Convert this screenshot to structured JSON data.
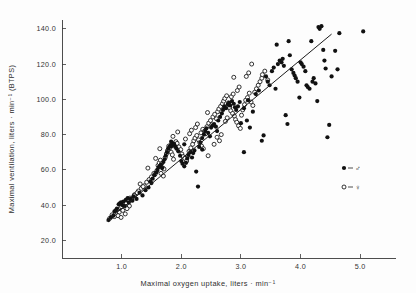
{
  "figure": {
    "background_color": "#fdfdfd",
    "ink_color": "#111111"
  },
  "legend": {
    "position": "bottom-right",
    "entries": [
      {
        "symbol": "filled-circle",
        "separator": "=",
        "label": "♂",
        "meaning": "male"
      },
      {
        "symbol": "open-circle",
        "separator": "=",
        "label": "♀",
        "meaning": "female"
      }
    ]
  },
  "chart_data": {
    "type": "scatter",
    "title": "",
    "subtitle": "",
    "xlabel": "Maximal oxygen uptake, liters · min⁻¹",
    "ylabel": "Maximal ventilation, liters · min⁻¹ (BTPS)",
    "xlim": [
      0.0,
      5.6
    ],
    "ylim": [
      10.0,
      145.0
    ],
    "xticks": [
      1.0,
      2.0,
      3.0,
      4.0,
      5.0
    ],
    "xtick_labels": [
      "1.0",
      "2.0",
      "3.0",
      "4.0",
      "5.0"
    ],
    "yticks": [
      20.0,
      40.0,
      60.0,
      80.0,
      100.0,
      120.0,
      140.0
    ],
    "ytick_labels": [
      "20.0",
      "40.0",
      "60.0",
      "80.0",
      "100.0",
      "120.0",
      "140.0"
    ],
    "grid": false,
    "legend_position": "lower right",
    "axes_spines": [
      "left",
      "bottom"
    ],
    "trendline": {
      "type": "linear-regression",
      "x_start": 0.75,
      "y_start": 31.0,
      "x_end": 4.52,
      "y_end": 137.0,
      "color": "#1c1c1c"
    },
    "series": [
      {
        "name": "♂",
        "marker": "filled-circle",
        "color": "#111111",
        "points": [
          [
            0.78,
            31.5
          ],
          [
            0.82,
            33.0
          ],
          [
            0.86,
            34.0
          ],
          [
            0.88,
            36.5
          ],
          [
            0.92,
            38.0
          ],
          [
            0.95,
            40.5
          ],
          [
            0.97,
            41.0
          ],
          [
            0.99,
            41.5
          ],
          [
            1.01,
            40.0
          ],
          [
            1.03,
            42.0
          ],
          [
            1.05,
            39.5
          ],
          [
            1.07,
            43.0
          ],
          [
            1.1,
            44.0
          ],
          [
            1.12,
            41.5
          ],
          [
            1.15,
            43.5
          ],
          [
            1.2,
            45.0
          ],
          [
            1.25,
            43.5
          ],
          [
            1.3,
            47.0
          ],
          [
            1.35,
            45.5
          ],
          [
            1.4,
            48.5
          ],
          [
            1.45,
            50.0
          ],
          [
            1.5,
            52.5
          ],
          [
            1.52,
            55.0
          ],
          [
            1.55,
            57.0
          ],
          [
            1.58,
            58.5
          ],
          [
            1.6,
            60.0
          ],
          [
            1.62,
            61.5
          ],
          [
            1.64,
            62.0
          ],
          [
            1.66,
            63.0
          ],
          [
            1.68,
            61.0
          ],
          [
            1.7,
            64.5
          ],
          [
            1.72,
            66.0
          ],
          [
            1.74,
            68.0
          ],
          [
            1.76,
            70.0
          ],
          [
            1.78,
            72.0
          ],
          [
            1.8,
            73.0
          ],
          [
            1.82,
            74.0
          ],
          [
            1.84,
            73.5
          ],
          [
            1.86,
            75.0
          ],
          [
            1.88,
            74.5
          ],
          [
            1.9,
            73.0
          ],
          [
            1.92,
            72.0
          ],
          [
            1.95,
            70.5
          ],
          [
            1.98,
            68.0
          ],
          [
            2.0,
            65.0
          ],
          [
            2.02,
            63.5
          ],
          [
            2.05,
            62.0
          ],
          [
            2.08,
            64.0
          ],
          [
            2.1,
            66.5
          ],
          [
            2.12,
            68.5
          ],
          [
            2.15,
            70.0
          ],
          [
            2.18,
            67.0
          ],
          [
            2.2,
            69.5
          ],
          [
            2.22,
            71.0
          ],
          [
            2.25,
            59.0
          ],
          [
            2.28,
            50.5
          ],
          [
            2.3,
            73.0
          ],
          [
            2.32,
            75.5
          ],
          [
            2.35,
            78.0
          ],
          [
            2.38,
            80.0
          ],
          [
            2.4,
            82.0
          ],
          [
            2.42,
            83.5
          ],
          [
            2.45,
            81.0
          ],
          [
            2.48,
            79.0
          ],
          [
            2.5,
            84.0
          ],
          [
            2.55,
            86.0
          ],
          [
            2.58,
            84.5
          ],
          [
            2.62,
            88.0
          ],
          [
            2.65,
            90.0
          ],
          [
            2.68,
            92.0
          ],
          [
            2.7,
            94.0
          ],
          [
            2.72,
            96.0
          ],
          [
            2.75,
            95.0
          ],
          [
            2.78,
            97.0
          ],
          [
            2.8,
            98.0
          ],
          [
            2.82,
            96.5
          ],
          [
            2.85,
            99.0
          ],
          [
            2.88,
            97.5
          ],
          [
            2.9,
            95.5
          ],
          [
            2.92,
            94.0
          ],
          [
            2.95,
            96.0
          ],
          [
            2.98,
            98.5
          ],
          [
            3.0,
            86.5
          ],
          [
            3.05,
            70.0
          ],
          [
            3.1,
            88.0
          ],
          [
            3.15,
            84.0
          ],
          [
            3.2,
            93.0
          ],
          [
            3.25,
            103.0
          ],
          [
            3.3,
            105.0
          ],
          [
            3.35,
            76.5
          ],
          [
            3.38,
            79.5
          ],
          [
            3.42,
            113.0
          ],
          [
            3.45,
            110.0
          ],
          [
            3.48,
            108.0
          ],
          [
            3.52,
            116.0
          ],
          [
            3.55,
            118.0
          ],
          [
            3.58,
            106.0
          ],
          [
            3.6,
            131.0
          ],
          [
            3.62,
            120.0
          ],
          [
            3.65,
            122.0
          ],
          [
            3.68,
            121.0
          ],
          [
            3.7,
            123.0
          ],
          [
            3.72,
            119.0
          ],
          [
            3.75,
            91.0
          ],
          [
            3.78,
            86.0
          ],
          [
            3.8,
            133.0
          ],
          [
            3.82,
            125.0
          ],
          [
            3.85,
            117.0
          ],
          [
            3.88,
            115.0
          ],
          [
            3.9,
            113.5
          ],
          [
            3.92,
            112.0
          ],
          [
            3.95,
            110.0
          ],
          [
            3.98,
            101.0
          ],
          [
            4.0,
            121.0
          ],
          [
            4.02,
            120.0
          ],
          [
            4.05,
            118.5
          ],
          [
            4.08,
            116.0
          ],
          [
            4.1,
            108.0
          ],
          [
            4.12,
            107.0
          ],
          [
            4.15,
            106.0
          ],
          [
            4.18,
            133.0
          ],
          [
            4.2,
            110.0
          ],
          [
            4.22,
            112.0
          ],
          [
            4.25,
            109.0
          ],
          [
            4.28,
            99.0
          ],
          [
            4.3,
            141.0
          ],
          [
            4.32,
            140.0
          ],
          [
            4.35,
            141.5
          ],
          [
            4.38,
            128.0
          ],
          [
            4.4,
            122.0
          ],
          [
            4.42,
            117.5
          ],
          [
            4.45,
            78.5
          ],
          [
            4.48,
            85.5
          ],
          [
            4.52,
            113.0
          ],
          [
            4.58,
            127.5
          ],
          [
            4.62,
            117.0
          ],
          [
            4.65,
            137.5
          ],
          [
            5.05,
            138.5
          ],
          [
            2.6,
            82.0
          ],
          [
            2.35,
            71.5
          ],
          [
            1.48,
            53.5
          ],
          [
            1.18,
            42.5
          ],
          [
            0.9,
            37.0
          ],
          [
            3.05,
            95.0
          ],
          [
            3.12,
            99.5
          ],
          [
            2.52,
            85.0
          ],
          [
            2.05,
            74.5
          ],
          [
            1.83,
            76.0
          ]
        ]
      },
      {
        "name": "♀",
        "marker": "open-circle",
        "color": "#111111",
        "points": [
          [
            0.8,
            32.5
          ],
          [
            0.84,
            34.5
          ],
          [
            0.88,
            33.5
          ],
          [
            0.9,
            35.5
          ],
          [
            0.93,
            37.5
          ],
          [
            0.96,
            36.0
          ],
          [
            0.98,
            38.5
          ],
          [
            1.0,
            39.0
          ],
          [
            1.02,
            37.0
          ],
          [
            1.04,
            40.5
          ],
          [
            1.06,
            35.0
          ],
          [
            1.08,
            41.0
          ],
          [
            1.11,
            42.5
          ],
          [
            1.14,
            44.0
          ],
          [
            1.17,
            43.0
          ],
          [
            1.22,
            46.0
          ],
          [
            1.28,
            48.0
          ],
          [
            1.33,
            49.5
          ],
          [
            1.38,
            51.0
          ],
          [
            1.42,
            53.0
          ],
          [
            1.46,
            54.5
          ],
          [
            1.5,
            56.0
          ],
          [
            1.54,
            58.0
          ],
          [
            1.56,
            57.5
          ],
          [
            1.59,
            59.5
          ],
          [
            1.61,
            62.5
          ],
          [
            1.63,
            64.0
          ],
          [
            1.65,
            65.5
          ],
          [
            1.67,
            63.5
          ],
          [
            1.69,
            61.0
          ],
          [
            1.71,
            60.5
          ],
          [
            1.73,
            67.0
          ],
          [
            1.75,
            69.0
          ],
          [
            1.77,
            71.0
          ],
          [
            1.79,
            73.5
          ],
          [
            1.81,
            72.5
          ],
          [
            1.83,
            70.0
          ],
          [
            1.85,
            68.5
          ],
          [
            1.87,
            66.0
          ],
          [
            1.89,
            74.0
          ],
          [
            1.91,
            76.0
          ],
          [
            1.93,
            75.0
          ],
          [
            1.96,
            73.0
          ],
          [
            1.99,
            71.5
          ],
          [
            2.01,
            69.0
          ],
          [
            2.03,
            67.5
          ],
          [
            2.06,
            66.5
          ],
          [
            2.09,
            65.0
          ],
          [
            2.11,
            68.0
          ],
          [
            2.13,
            70.5
          ],
          [
            2.16,
            72.5
          ],
          [
            2.19,
            74.5
          ],
          [
            2.21,
            76.5
          ],
          [
            2.23,
            78.0
          ],
          [
            2.26,
            79.5
          ],
          [
            2.29,
            77.0
          ],
          [
            2.31,
            75.5
          ],
          [
            2.33,
            81.0
          ],
          [
            2.36,
            83.0
          ],
          [
            2.39,
            82.0
          ],
          [
            2.41,
            80.5
          ],
          [
            2.43,
            84.5
          ],
          [
            2.46,
            86.5
          ],
          [
            2.49,
            88.0
          ],
          [
            2.51,
            85.5
          ],
          [
            2.53,
            90.0
          ],
          [
            2.56,
            91.5
          ],
          [
            2.59,
            89.0
          ],
          [
            2.61,
            93.0
          ],
          [
            2.63,
            94.5
          ],
          [
            2.66,
            96.0
          ],
          [
            2.69,
            97.5
          ],
          [
            2.71,
            99.0
          ],
          [
            2.73,
            100.5
          ],
          [
            2.76,
            102.0
          ],
          [
            2.79,
            98.0
          ],
          [
            2.81,
            95.0
          ],
          [
            2.83,
            93.5
          ],
          [
            2.86,
            92.0
          ],
          [
            2.89,
            90.5
          ],
          [
            2.91,
            88.5
          ],
          [
            2.93,
            87.0
          ],
          [
            2.96,
            85.0
          ],
          [
            2.99,
            83.5
          ],
          [
            3.01,
            91.0
          ],
          [
            3.03,
            94.0
          ],
          [
            3.06,
            97.0
          ],
          [
            3.08,
            99.5
          ],
          [
            3.11,
            101.0
          ],
          [
            3.14,
            103.5
          ],
          [
            3.17,
            98.5
          ],
          [
            3.2,
            96.5
          ],
          [
            3.23,
            104.0
          ],
          [
            3.26,
            106.0
          ],
          [
            3.29,
            108.0
          ],
          [
            3.32,
            110.0
          ],
          [
            3.35,
            112.0
          ],
          [
            3.4,
            116.0
          ],
          [
            3.45,
            111.0
          ],
          [
            3.18,
            120.0
          ],
          [
            2.45,
            68.0
          ],
          [
            2.55,
            74.5
          ],
          [
            2.6,
            78.5
          ],
          [
            2.64,
            76.5
          ],
          [
            2.67,
            80.0
          ],
          [
            2.74,
            87.5
          ],
          [
            2.77,
            89.5
          ],
          [
            2.84,
            101.5
          ],
          [
            2.87,
            103.0
          ],
          [
            2.94,
            105.0
          ],
          [
            2.97,
            107.0
          ],
          [
            1.44,
            61.0
          ],
          [
            1.57,
            66.5
          ],
          [
            1.66,
            58.0
          ],
          [
            1.7,
            56.5
          ],
          [
            2.24,
            84.0
          ],
          [
            2.27,
            86.0
          ],
          [
            2.34,
            73.5
          ],
          [
            2.37,
            72.0
          ],
          [
            1.36,
            50.5
          ],
          [
            1.31,
            52.0
          ],
          [
            1.26,
            47.0
          ],
          [
            1.21,
            45.5
          ],
          [
            1.13,
            39.5
          ],
          [
            1.09,
            38.0
          ],
          [
            0.94,
            34.0
          ],
          [
            0.99,
            33.0
          ],
          [
            2.07,
            77.5
          ],
          [
            2.14,
            80.5
          ],
          [
            2.17,
            82.5
          ],
          [
            3.09,
            113.0
          ],
          [
            3.13,
            115.0
          ],
          [
            3.36,
            114.0
          ],
          [
            2.88,
            112.5
          ],
          [
            1.64,
            72.0
          ],
          [
            1.86,
            79.0
          ],
          [
            1.94,
            81.5
          ],
          [
            2.44,
            92.5
          ]
        ]
      }
    ]
  }
}
